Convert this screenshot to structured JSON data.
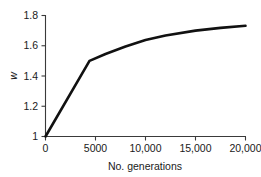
{
  "chart_data": {
    "type": "line",
    "title": "",
    "subtitle": "",
    "xlabel": "No. generations",
    "ylabel": "w",
    "xlim": [
      0,
      20000
    ],
    "ylim": [
      1.0,
      1.8
    ],
    "grid": false,
    "legend": false,
    "legend_position": "none",
    "line_color": "#111111",
    "axis_color": "#3a3a3a",
    "background_color": "#ffffff",
    "x_ticks": [
      0,
      5000,
      10000,
      15000,
      20000
    ],
    "x_tick_labels": [
      "0",
      "5000",
      "10,000",
      "15,000",
      "20,000"
    ],
    "y_ticks": [
      1.0,
      1.2,
      1.4,
      1.6,
      1.8
    ],
    "y_tick_labels": [
      "1",
      "1.2",
      "1.4",
      "1.6",
      "1.8"
    ],
    "series": [
      {
        "name": "mean fitness",
        "x": [
          0,
          4400,
          6000,
          8000,
          10000,
          12000,
          15000,
          17500,
          20000
        ],
        "values": [
          1.0,
          1.5,
          1.545,
          1.595,
          1.638,
          1.668,
          1.7,
          1.718,
          1.732
        ]
      }
    ]
  },
  "figure": {
    "width": 261,
    "height": 177
  }
}
